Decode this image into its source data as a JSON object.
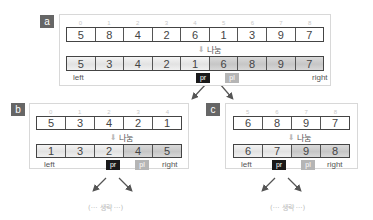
{
  "divide_label": "나눔",
  "omitted_label": "(··· 생략 ···)",
  "labels": {
    "left": "left",
    "right": "right",
    "pr": "pr",
    "pl": "pl"
  },
  "panels": {
    "a": {
      "tag": "a",
      "indices": [
        "0",
        "1",
        "2",
        "3",
        "4",
        "5",
        "6",
        "7",
        "8"
      ],
      "before": [
        "5",
        "8",
        "4",
        "2",
        "6",
        "1",
        "3",
        "9",
        "7"
      ],
      "after": [
        "5",
        "3",
        "4",
        "2",
        "1",
        "6",
        "8",
        "9",
        "7"
      ]
    },
    "b": {
      "tag": "b",
      "indices": [
        "0",
        "1",
        "2",
        "3",
        "4"
      ],
      "before": [
        "5",
        "3",
        "4",
        "2",
        "1"
      ],
      "after": [
        "1",
        "3",
        "2",
        "4",
        "5"
      ]
    },
    "c": {
      "tag": "c",
      "indices": [
        "5",
        "6",
        "7",
        "8"
      ],
      "before": [
        "6",
        "8",
        "9",
        "7"
      ],
      "after": [
        "6",
        "7",
        "9",
        "8"
      ]
    }
  }
}
